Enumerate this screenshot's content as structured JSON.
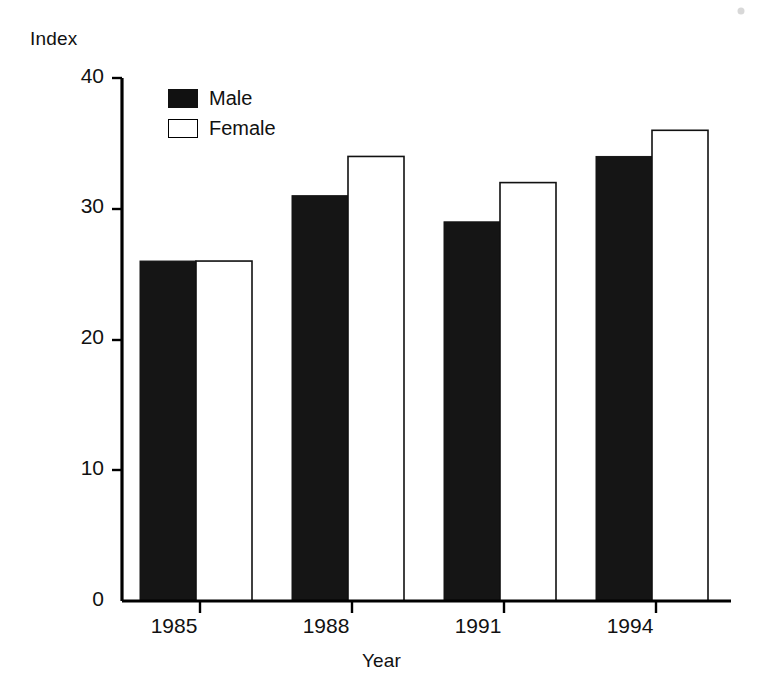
{
  "chart_data": {
    "type": "bar",
    "title": "",
    "subtitle": "",
    "xlabel": "Year",
    "ylabel": "Index",
    "categories": [
      "1985",
      "1988",
      "1991",
      "1994"
    ],
    "series": [
      {
        "name": "Male",
        "values": [
          26,
          31,
          29,
          34
        ],
        "color": "#151515",
        "style": "filled"
      },
      {
        "name": "Female",
        "values": [
          26,
          34,
          32,
          36
        ],
        "color": "#ffffff",
        "style": "hollow-outlined"
      }
    ],
    "ylim": [
      0,
      40
    ],
    "yticks": [
      0,
      10,
      20,
      30,
      40
    ],
    "ytick_labels": [
      "0",
      "10",
      "20",
      "30",
      "40"
    ],
    "xtick_labels": [
      "1985",
      "1988",
      "1991",
      "1994"
    ],
    "grid": false,
    "legend_position": "upper-left-inside",
    "bar_grouping": "grouped-adjacent",
    "axis_style": "left-and-bottom-spines-only"
  },
  "axes": {
    "y_axis_title": "Index",
    "x_axis_title": "Year"
  },
  "legend": {
    "entries": [
      {
        "label": "Male",
        "swatch": "filled-black-square"
      },
      {
        "label": "Female",
        "swatch": "hollow-outlined-square"
      }
    ]
  },
  "colors": {
    "male": "#151515",
    "female": "#ffffff",
    "outline": "#111111",
    "axis": "#000000",
    "background": "#ffffff"
  }
}
